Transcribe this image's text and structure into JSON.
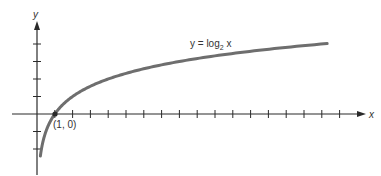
{
  "chart_data": {
    "type": "line",
    "title": "",
    "function": "y = log2 x",
    "xlabel": "x",
    "ylabel": "y",
    "x_ticks": [
      1,
      2,
      3,
      4,
      5,
      6,
      7,
      8,
      9,
      10,
      11,
      12,
      13,
      14,
      15,
      16,
      17
    ],
    "y_ticks": [
      -2,
      -1,
      1,
      2,
      3,
      4
    ],
    "xlim": [
      -1.3,
      18.5
    ],
    "ylim": [
      -3.2,
      5.1
    ],
    "grid": false,
    "series": [
      {
        "name": "y = log2 x",
        "x": [
          0.2,
          0.25,
          0.5,
          1,
          2,
          4,
          8,
          16
        ],
        "y": [
          -2.32,
          -2,
          -1,
          0,
          1,
          2,
          3,
          4
        ]
      }
    ],
    "annotations": [
      {
        "text": "(1, 0)",
        "x": 1,
        "y": 0
      },
      {
        "text": "y = log₂ x",
        "x": 11.5,
        "y": 3.8
      }
    ]
  },
  "labels": {
    "y_axis": "y",
    "x_axis": "x",
    "curve_label_prefix": "y = log",
    "curve_label_sub": "2",
    "curve_label_suffix": " x",
    "point_label": "(1, 0)"
  },
  "colors": {
    "axis": "#2a2a2a",
    "curve": "#6e6e6e",
    "text": "#333333"
  }
}
